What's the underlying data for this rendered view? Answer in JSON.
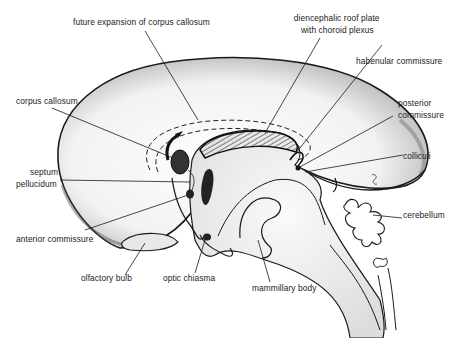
{
  "figure": {
    "labels": {
      "future_expansion": "future expansion of corpus callosum",
      "diencephalic_roof_1": "diencephalic roof plate",
      "diencephalic_roof_2": "with choroid plexus",
      "habenular": "habenular commissure",
      "posterior_1": "posterior",
      "posterior_2": "commissure",
      "corpus_callosum": "corpus callosum",
      "colliculi": "colliculi",
      "septum_1": "septum",
      "septum_2": "pellucidum",
      "cerebellum": "cerebellum",
      "anterior_commissure": "anterior commissure",
      "olfactory_bulb": "olfactory bulb",
      "optic_chiasma": "optic chiasma",
      "mammillary_body": "mammillary body"
    },
    "colors": {
      "line": "#1a1a1a",
      "stipple": "#9a9a9a",
      "background": "#ffffff"
    }
  }
}
